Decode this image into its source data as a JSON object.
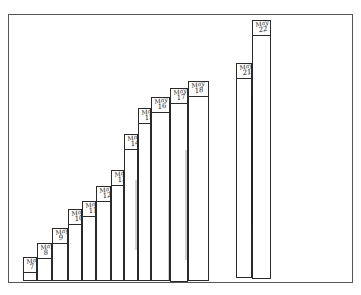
{
  "figure": {
    "frame_color": "#555555",
    "line_color": "#2a2a2a",
    "background": "#ffffff"
  },
  "strips": [
    {
      "label_month": "May",
      "label_day": "7",
      "x": 23,
      "w": 14,
      "top": 257,
      "bottom": 281
    },
    {
      "label_month": "May",
      "label_day": "8",
      "x": 37,
      "w": 15,
      "top": 243,
      "bottom": 281
    },
    {
      "label_month": "May",
      "label_day": "9",
      "x": 52,
      "w": 16,
      "top": 228,
      "bottom": 281
    },
    {
      "label_month": "May",
      "label_day": "10",
      "x": 68,
      "w": 14,
      "top": 209,
      "bottom": 281
    },
    {
      "label_month": "May",
      "label_day": "11",
      "x": 82,
      "w": 14,
      "top": 201,
      "bottom": 281
    },
    {
      "label_month": "May",
      "label_day": "12",
      "x": 96,
      "w": 15,
      "top": 186,
      "bottom": 281
    },
    {
      "label_month": "May",
      "label_day": "13",
      "x": 111,
      "w": 13,
      "top": 170,
      "bottom": 281
    },
    {
      "label_month": "May",
      "label_day": "14",
      "x": 124,
      "w": 14,
      "top": 134,
      "bottom": 281
    },
    {
      "label_month": "May",
      "label_day": "15",
      "x": 138,
      "w": 13,
      "top": 108,
      "bottom": 281
    },
    {
      "label_month": "May",
      "label_day": "16",
      "x": 151,
      "w": 19,
      "top": 97,
      "bottom": 281
    },
    {
      "label_month": "May",
      "label_day": "17",
      "x": 170,
      "w": 18,
      "top": 88,
      "bottom": 282
    },
    {
      "label_month": "May",
      "label_day": "18",
      "x": 188,
      "w": 21,
      "top": 81,
      "bottom": 281
    },
    {
      "label_month": "May",
      "label_day": "21",
      "x": 236,
      "w": 16,
      "top": 63,
      "bottom": 278
    },
    {
      "label_month": "May",
      "label_day": "22",
      "x": 252,
      "w": 19,
      "top": 20,
      "bottom": 279
    }
  ]
}
